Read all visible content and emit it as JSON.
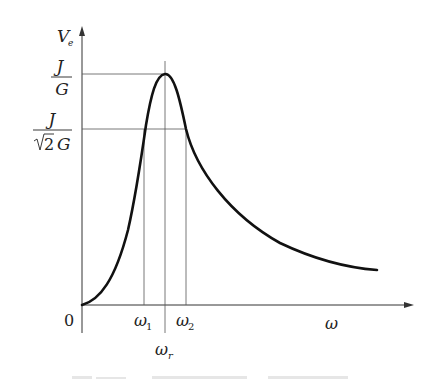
{
  "diagram": {
    "type": "resonance-curve",
    "y_axis": {
      "label": "V",
      "label_subscript": "e"
    },
    "x_axis": {
      "label": "ω",
      "origin_label": "0"
    },
    "y_marks": [
      {
        "numerator": "J",
        "denominator": "G",
        "meaning": "peak value"
      },
      {
        "numerator": "J",
        "denominator_root": "2",
        "denominator_rest": "G",
        "meaning": "half-power value"
      }
    ],
    "x_marks": [
      {
        "symbol": "ω",
        "subscript": "1"
      },
      {
        "symbol": "ω",
        "subscript": "r"
      },
      {
        "symbol": "ω",
        "subscript": "2"
      }
    ],
    "curve": {
      "description": "Voltage magnitude vs angular frequency; rises from origin, peaks at ω_r with value J/G, crosses J/(√2 G) at ω1 and ω2, then decays toward the right.",
      "color": "#111111"
    },
    "guide_line_color": "#555555",
    "axis_color": "#333333"
  }
}
